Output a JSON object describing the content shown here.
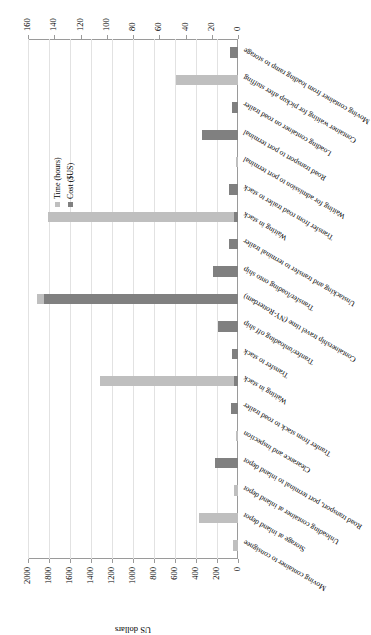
{
  "chart_data": {
    "type": "bar",
    "title": "",
    "subtitle": "",
    "orientation": "vertical-rotated",
    "xlabel": "",
    "ylabel": "US dollars",
    "y2label": "Hours",
    "ylim": [
      0,
      2000
    ],
    "y2lim": [
      0,
      160
    ],
    "ytick_step": 200,
    "y2tick_step": 20,
    "yticks": [
      0,
      200,
      400,
      600,
      800,
      1000,
      1200,
      1400,
      1600,
      1800,
      2000
    ],
    "y2ticks": [
      0,
      20,
      40,
      60,
      80,
      100,
      120,
      140,
      160
    ],
    "grid": true,
    "legend_position": "right",
    "categories": [
      "Moving container to consignee",
      "Storage at inland depot",
      "Unloading container at inland depot",
      "Road transport, port terminal to inland depot",
      "Clearance and inspection",
      "Tranfer from stack to road trailer",
      "Waiting in stack",
      "Transfer to stack",
      "Tranfer/unloading off ship",
      "Containership travel time (NY-Rotterdam)",
      "Transfer/loading onto ship",
      "Unstacking and transfer to terminal trailer",
      "Waiting in stack",
      "Transfer from road trailer to stack",
      "Waiting for admission to port terminal",
      "Road transport to port terminal",
      "Loading container on road trailer",
      "Container waiting for pickup after stuffing",
      "Moving container from loading ramp to storage"
    ],
    "series": [
      {
        "name": "Time (hours)",
        "unit": "hours",
        "axis": "secondary",
        "color": "#bfbfbf",
        "values": [
          3.5,
          29.5,
          3.3,
          13.5,
          1.6,
          0,
          105,
          0,
          0,
          153,
          0,
          0,
          145,
          0,
          1.5,
          0,
          0,
          47,
          0
        ]
      },
      {
        "name": "Cost ($US)",
        "unit": "US dollars",
        "axis": "primary",
        "color": "#808080",
        "values": [
          0,
          0,
          0,
          215,
          0,
          65,
          35,
          62,
          190,
          1850,
          235,
          90,
          40,
          85,
          0,
          345,
          58,
          0,
          72
        ]
      }
    ],
    "legend": [
      {
        "label": "Time (hours)",
        "color": "#bfbfbf"
      },
      {
        "label": "Cost ($US)",
        "color": "#808080"
      }
    ]
  }
}
